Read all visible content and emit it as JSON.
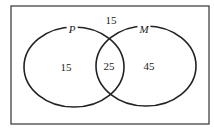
{
  "venn": {
    "sets": [
      {
        "name": "P",
        "only": "15"
      },
      {
        "name": "M",
        "only": "45"
      }
    ],
    "intersection": "25",
    "outside": "15"
  },
  "colors": {
    "stroke": "#222222",
    "background": "#ffffff"
  }
}
